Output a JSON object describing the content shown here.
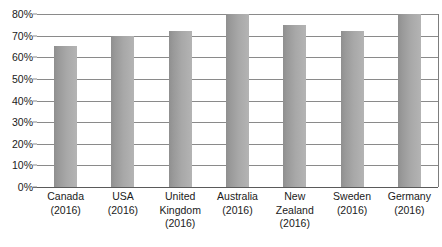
{
  "chart_data": {
    "type": "bar",
    "title": "",
    "subtitle": "",
    "xlabel": "",
    "ylabel": "",
    "categories": [
      "Canada",
      "USA",
      "United Kingdom",
      "Australia",
      "New Zealand",
      "Sweden",
      "Germany"
    ],
    "category_years": [
      "(2016)",
      "(2016)",
      "(2016)",
      "(2016)",
      "(2016)",
      "(2016)",
      "(2016)"
    ],
    "values": [
      65,
      70,
      72,
      80,
      75,
      72,
      80
    ],
    "value_labels": [
      "65%",
      "70%",
      "72%",
      "80%",
      "75%",
      "72%",
      "80%"
    ],
    "ylim": [
      0,
      80
    ],
    "ytick_values": [
      80,
      70,
      60,
      50,
      40,
      30,
      20,
      10,
      0
    ],
    "ytick_labels": [
      "80%",
      "70%",
      "60%",
      "50%",
      "40%",
      "30%",
      "20%",
      "10%",
      "0%"
    ],
    "grid": true,
    "legend": null,
    "legend_position": "none",
    "series_name": "",
    "bar_color": "#a0a0a0",
    "bar_color_dark": "#8f8f8f",
    "bar_color_light": "#b4b4b4",
    "gridline_color": "#8a8a8a",
    "axis_color": "#5a5a5a",
    "text_color": "#1a1a1a",
    "background": "#ffffff"
  }
}
